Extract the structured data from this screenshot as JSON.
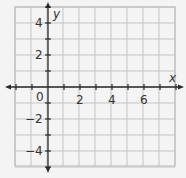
{
  "chart_data": {
    "type": "scatter",
    "title": "",
    "xlabel": "x",
    "ylabel": "y",
    "xlim": [
      -2,
      8
    ],
    "ylim": [
      -5,
      5
    ],
    "grid": true,
    "grid_step": 1,
    "x_tick_labels": [
      "0",
      "2",
      "4",
      "6"
    ],
    "y_tick_labels": [
      "4",
      "2",
      "-2",
      "-4"
    ],
    "series": [],
    "colors": {
      "grid": "#c4c4c4",
      "axis": "#2a2a2a",
      "background": "#f4f4f4"
    }
  },
  "labels": {
    "x_axis": "x",
    "y_axis": "y",
    "origin": "0",
    "x2": "2",
    "x4": "4",
    "x6": "6",
    "y4": "4",
    "y2": "2",
    "yneg2": "−2",
    "yneg4": "−4"
  }
}
